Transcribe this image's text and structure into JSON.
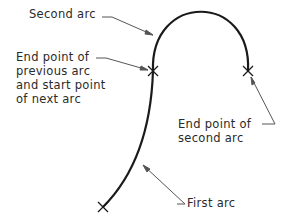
{
  "labels": {
    "second_arc": "Second arc",
    "end_prev_line1": "End point of",
    "end_prev_line2": "previous arc",
    "end_prev_line3": "and start point",
    "end_prev_line4": "of next arc",
    "end_second_line1": "End point of",
    "end_second_line2": "second arc",
    "first_arc": "First arc"
  },
  "colors": {
    "arc": "#1a1a1a",
    "leader": "#555555",
    "text": "#2a2a2a"
  }
}
